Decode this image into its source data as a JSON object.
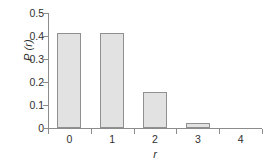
{
  "chart_data": {
    "type": "bar",
    "title": "",
    "subtitle": "",
    "categories": [
      "0",
      "1",
      "2",
      "3",
      "4"
    ],
    "values": [
      0.415,
      0.412,
      0.155,
      0.022,
      0
    ],
    "xlabel": "r",
    "ylabel": "P (r)",
    "ylim": [
      0,
      0.5
    ],
    "xlim": [
      -0.5,
      4.5
    ],
    "y_ticks": [
      "0.5",
      "0.4",
      "0.3",
      "0.2",
      "0.1",
      "0"
    ],
    "y_tick_values": [
      0.5,
      0.4,
      0.3,
      0.2,
      0.1,
      0
    ],
    "x_ticks": [
      "0",
      "1",
      "2",
      "3",
      "4"
    ],
    "grid": false,
    "legend": false,
    "legend_position": "none",
    "series": [
      {
        "name": "P(r)",
        "values": [
          0.415,
          0.412,
          0.155,
          0.022,
          0
        ]
      }
    ],
    "annotations": []
  },
  "style": {
    "bar_fill": "#e2e2e2",
    "bar_border": "#909090",
    "axis_color": "#8c8c8c",
    "text_color": "#2f2f2f",
    "background": "#ffffff"
  }
}
